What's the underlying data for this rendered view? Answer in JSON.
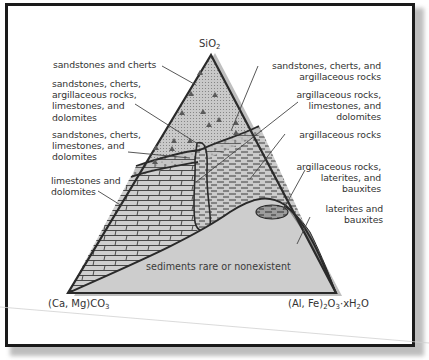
{
  "diagram": {
    "type": "ternary",
    "vertices": {
      "top": {
        "label": "SiO",
        "sub": "2",
        "full": "SiO2"
      },
      "bottom_left": {
        "label": "(Ca, Mg)CO",
        "sub": "3",
        "full": "(Ca, Mg)CO3"
      },
      "bottom_right": {
        "prefix": "(Al, Fe)",
        "sub1": "2",
        "mid": "O",
        "sub2": "3",
        "suffix": "·xH",
        "sub3": "2",
        "end": "O",
        "full": "(Al, Fe)2O3·xH2O"
      }
    },
    "regions": [
      {
        "id": "sandstones-cherts",
        "label": "sandstones and cherts",
        "pattern": "dots-triangles"
      },
      {
        "id": "sandstones-cherts-argillaceous-limestones-dolomites",
        "label": "sandstones, cherts,\nargillaceous rocks,\nlimestones, and\ndolomites",
        "pattern": "mixed"
      },
      {
        "id": "sandstones-cherts-limestones-dolomites",
        "label": "sandstones, cherts,\nlimestones, and\ndolomites",
        "pattern": "dots-bricks"
      },
      {
        "id": "limestones-dolomites",
        "label": "limestones and\ndolomites",
        "pattern": "bricks"
      },
      {
        "id": "sandstones-cherts-argillaceous",
        "label": "sandstones, cherts, and\nargillaceous rocks",
        "pattern": "dots-dashes"
      },
      {
        "id": "argillaceous-limestones-dolomites",
        "label": "argillaceous rocks,\nlimestones, and\ndolomites",
        "pattern": "dashes-bricks"
      },
      {
        "id": "argillaceous",
        "label": "argillaceous rocks",
        "pattern": "dashes"
      },
      {
        "id": "argillaceous-laterites-bauxites",
        "label": "argillaceous rocks,\nlaterites, and\nbauxites",
        "pattern": "dashes-dark"
      },
      {
        "id": "laterites-bauxites",
        "label": "laterites and\nbauxites",
        "pattern": "dark"
      },
      {
        "id": "sediments-rare",
        "label": "sediments rare or nonexistent",
        "pattern": "plain"
      }
    ],
    "colors": {
      "frame": "#1a1a1a",
      "triangle_fill": "#c8c8c8",
      "rare_fill": "#cfcfcf",
      "dark_fill": "#8a8a8a",
      "outline": "#2a2a2a",
      "text": "#333333",
      "leader": "#444444"
    }
  }
}
